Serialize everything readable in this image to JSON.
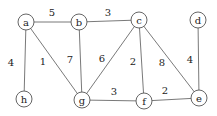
{
  "graph": {
    "nodes": [
      {
        "id": "a",
        "label": "a",
        "x": 26,
        "y": 22
      },
      {
        "id": "b",
        "label": "b",
        "x": 79,
        "y": 22
      },
      {
        "id": "c",
        "label": "c",
        "x": 139,
        "y": 20
      },
      {
        "id": "d",
        "label": "d",
        "x": 198,
        "y": 20
      },
      {
        "id": "h",
        "label": "h",
        "x": 24,
        "y": 99
      },
      {
        "id": "g",
        "label": "g",
        "x": 82,
        "y": 100
      },
      {
        "id": "f",
        "label": "f",
        "x": 144,
        "y": 101
      },
      {
        "id": "e",
        "label": "e",
        "x": 199,
        "y": 98
      }
    ],
    "edges": [
      {
        "from": "a",
        "to": "b",
        "weight": "5",
        "lx": 52,
        "ly": 16
      },
      {
        "from": "b",
        "to": "c",
        "weight": "3",
        "lx": 108,
        "ly": 16
      },
      {
        "from": "a",
        "to": "h",
        "weight": "4",
        "lx": 11,
        "ly": 66
      },
      {
        "from": "a",
        "to": "g",
        "weight": "1",
        "lx": 43,
        "ly": 65
      },
      {
        "from": "b",
        "to": "g",
        "weight": "7",
        "lx": 70,
        "ly": 63
      },
      {
        "from": "c",
        "to": "g",
        "weight": "6",
        "lx": 102,
        "ly": 62
      },
      {
        "from": "c",
        "to": "f",
        "weight": "2",
        "lx": 133,
        "ly": 65
      },
      {
        "from": "c",
        "to": "e",
        "weight": "8",
        "lx": 162,
        "ly": 66
      },
      {
        "from": "d",
        "to": "e",
        "weight": "4",
        "lx": 190,
        "ly": 63
      },
      {
        "from": "g",
        "to": "f",
        "weight": "3",
        "lx": 114,
        "ly": 95
      },
      {
        "from": "f",
        "to": "e",
        "weight": "2",
        "lx": 165,
        "ly": 94
      }
    ],
    "node_radius": 8
  }
}
